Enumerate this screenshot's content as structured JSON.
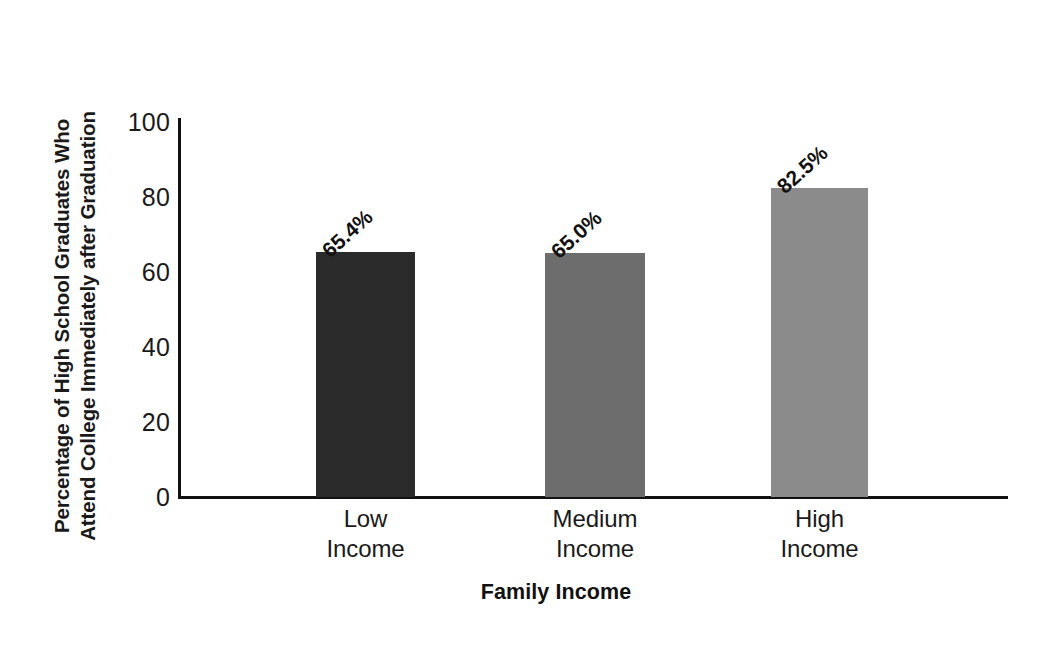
{
  "chart_data": {
    "type": "bar",
    "title": "",
    "xlabel": "Family Income",
    "ylabel": "Percentage of High School Graduates Who Attend College Immediately after Graduation",
    "ylabel_lines": [
      "Percentage of High School Graduates Who",
      "Attend College Immediately after Graduation"
    ],
    "categories": [
      "Low Income",
      "Medium Income",
      "High Income"
    ],
    "category_lines": [
      [
        "Low",
        "Income"
      ],
      [
        "Medium",
        "Income"
      ],
      [
        "High",
        "Income"
      ]
    ],
    "values": [
      65.4,
      65.0,
      82.5
    ],
    "data_labels": [
      "65.4%",
      "65.0%",
      "82.5%"
    ],
    "bar_colors": [
      "#2b2b2b",
      "#6d6d6d",
      "#8b8b8b"
    ],
    "ylim": [
      0,
      100
    ],
    "yticks": [
      0,
      20,
      40,
      60,
      80,
      100
    ],
    "ytick_labels": [
      "0",
      "20",
      "40",
      "60",
      "80",
      "100"
    ],
    "grid": false,
    "legend": false
  },
  "axis": {
    "y_title_line1": "Percentage of High School Graduates Who",
    "y_title_line2": "Attend College Immediately after Graduation",
    "x_title": "Family Income"
  },
  "ticks": {
    "t0": "0",
    "t20": "20",
    "t40": "40",
    "t60": "60",
    "t80": "80",
    "t100": "100"
  },
  "bars": [
    {
      "label_line1": "Low",
      "label_line2": "Income",
      "value_label": "65.4%",
      "value": 65.4,
      "color": "#2b2b2b"
    },
    {
      "label_line1": "Medium",
      "label_line2": "Income",
      "value_label": "65.0%",
      "value": 65.0,
      "color": "#6d6d6d"
    },
    {
      "label_line1": "High",
      "label_line2": "Income",
      "value_label": "82.5%",
      "value": 82.5,
      "color": "#8b8b8b"
    }
  ]
}
